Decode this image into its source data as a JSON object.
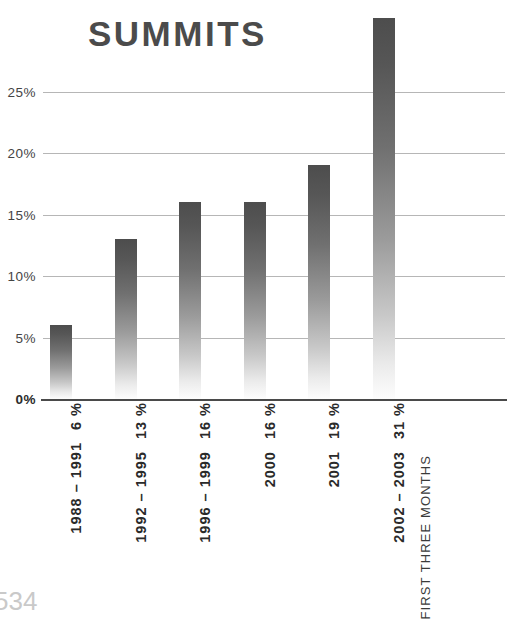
{
  "page": {
    "number": "534"
  },
  "footnote": {
    "text": "FIRST THREE MONTHS"
  },
  "chart_data": {
    "type": "bar",
    "title": "SUMMITS",
    "xlabel": "",
    "ylabel": "",
    "ylim": [
      0,
      31
    ],
    "yticks": [
      "0%",
      "5%",
      "10%",
      "15%",
      "20%",
      "25%"
    ],
    "ytick_values": [
      0,
      5,
      10,
      15,
      20,
      25
    ],
    "grid": true,
    "legend": "none",
    "categories": [
      "1988 – 1991",
      "1992 – 1995",
      "1996 – 1999",
      "2000",
      "2001",
      "2002 – 2003"
    ],
    "values": [
      6,
      13,
      16,
      16,
      19,
      31
    ],
    "value_labels": [
      "6 %",
      "13 %",
      "16 %",
      "16 %",
      "19 %",
      "31 %"
    ],
    "bar_gradient": {
      "top": "#4d4d4d",
      "bottom": "#fdfdfd"
    },
    "colors": {
      "title": "#4b4b4b",
      "gridline": "#b6b6b6",
      "baseline": "#4a4a4a",
      "tick_label": "#444444",
      "category_label": "#2a2a2a",
      "page_number": "#c9c9c9"
    },
    "annotations": [
      {
        "text": "FIRST THREE MONTHS",
        "attached_to": "2002 – 2003"
      }
    ]
  }
}
